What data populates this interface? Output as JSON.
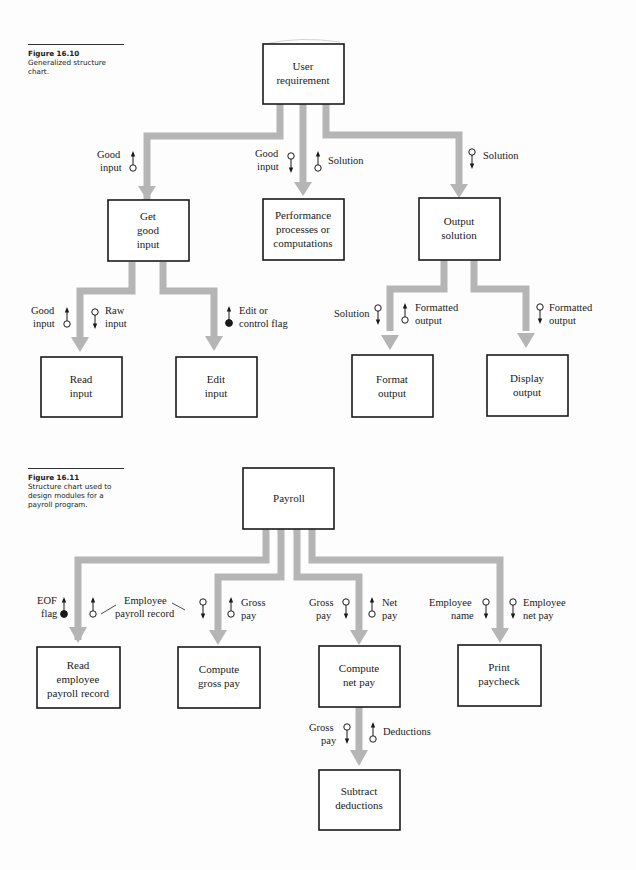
{
  "figures": [
    {
      "number": "Figure 16.10",
      "caption": "Generalized structure chart.",
      "modules": {
        "root": [
          "User",
          "requirement"
        ],
        "get_input": [
          "Get",
          "good",
          "input"
        ],
        "perform": [
          "Performance",
          "processes or",
          "computations"
        ],
        "output": [
          "Output",
          "solution"
        ],
        "read_input": [
          "Read",
          "input"
        ],
        "edit_input": [
          "Edit",
          "input"
        ],
        "format_output": [
          "Format",
          "output"
        ],
        "display_output": [
          "Display",
          "output"
        ]
      },
      "flows": {
        "root_get_good_input": [
          "Good",
          "input"
        ],
        "root_perform_good_input": [
          "Good",
          "input"
        ],
        "root_perform_solution": [
          "Solution"
        ],
        "root_output_solution": [
          "Solution"
        ],
        "get_read_good_input": [
          "Good",
          "input"
        ],
        "get_read_raw_input": [
          "Raw",
          "input"
        ],
        "get_edit_flag": [
          "Edit or",
          "control flag"
        ],
        "output_format_solution": [
          "Solution"
        ],
        "output_format_formatted": [
          "Formatted",
          "output"
        ],
        "output_display_formatted": [
          "Formatted",
          "output"
        ]
      }
    },
    {
      "number": "Figure 16.11",
      "caption": "Structure chart used to design modules for a payroll program.",
      "caption_lines": [
        "Structure chart used to",
        "design modules for a",
        "payroll program."
      ],
      "modules": {
        "root": [
          "Payroll"
        ],
        "read_record": [
          "Read",
          "employee",
          "payroll record"
        ],
        "gross_pay": [
          "Compute",
          "gross pay"
        ],
        "net_pay": [
          "Compute",
          "net pay"
        ],
        "print": [
          "Print",
          "paycheck"
        ],
        "subtract": [
          "Subtract",
          "deductions"
        ]
      },
      "flows": {
        "eof_flag": [
          "EOF",
          "flag"
        ],
        "employee_payroll_record": [
          "Employee",
          "payroll record"
        ],
        "gross_pay_up": [
          "Gross",
          "pay"
        ],
        "gross_pay_down": [
          "Gross",
          "pay"
        ],
        "net_pay_up": [
          "Net",
          "pay"
        ],
        "employee_name": [
          "Employee",
          "name"
        ],
        "employee_net_pay": [
          "Employee",
          "net pay"
        ],
        "sub_gross_pay": [
          "Gross",
          "pay"
        ],
        "deductions": [
          "Deductions"
        ]
      }
    }
  ],
  "captions_10": [
    "Generalized structure",
    "chart."
  ],
  "colors": {
    "connector": "#b5b5b5",
    "box_stroke": "#1a1a1a",
    "text": "#1a1a1a"
  }
}
